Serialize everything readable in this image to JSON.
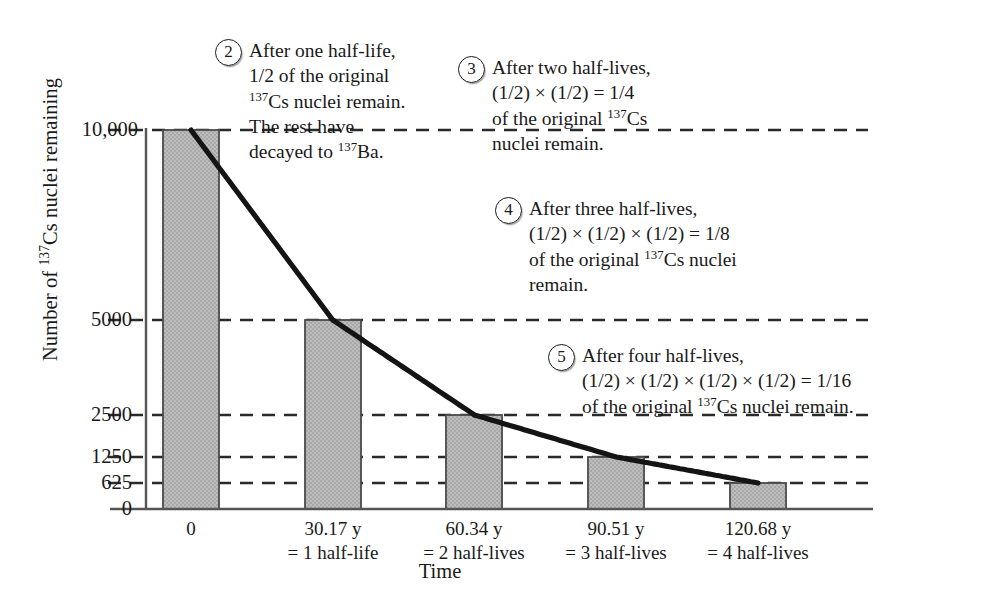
{
  "chart_data": {
    "type": "bar",
    "title": "",
    "xlabel": "Time",
    "ylabel": "Number of 137Cs nuclei remaining",
    "ylabel_parts": {
      "pre": "Number of ",
      "sup": "137",
      "post": "Cs nuclei remaining"
    },
    "categories": [
      "0",
      "30.17 y",
      "60.34 y",
      "90.51 y",
      "120.68 y"
    ],
    "category_sublabels": [
      "",
      "= 1 half-life",
      "= 2 half-lives",
      "= 3 half-lives",
      "= 4 half-lives"
    ],
    "values": [
      10000,
      5000,
      2500,
      1250,
      625
    ],
    "ytick_labels": [
      "10,000",
      "5000",
      "2500",
      "1250",
      "625",
      "0"
    ],
    "ytick_values": [
      10000,
      5000,
      2500,
      1250,
      625,
      0
    ],
    "ylim": [
      0,
      10000
    ],
    "grid": "dashed-horizontal",
    "legend": "none",
    "overlay_curve": {
      "name": "exponential decay",
      "equation": "N = 10000 * (1/2)^(t/30.17)",
      "half_life_years": 30.17
    },
    "colors": {
      "bar_fill": "#b5b5b5",
      "bar_edge": "#4a4a4a",
      "curve": "#141414",
      "axis": "#555555",
      "grid": "#2a2a2a",
      "text": "#1a1a1a"
    }
  },
  "annotations": [
    {
      "number": "2",
      "lines": [
        {
          "pre": "After one half-life,",
          "sup": "",
          "post": ""
        },
        {
          "pre": "1/2 of the original",
          "sup": "",
          "post": ""
        },
        {
          "pre": "",
          "sup": "137",
          "post": "Cs nuclei remain."
        },
        {
          "pre": "The rest have",
          "sup": "",
          "post": ""
        },
        {
          "pre": "decayed to ",
          "sup": "137",
          "post": "Ba."
        }
      ]
    },
    {
      "number": "3",
      "lines": [
        {
          "pre": "After two half-lives,",
          "sup": "",
          "post": ""
        },
        {
          "pre": "(1/2) × (1/2) = 1/4",
          "sup": "",
          "post": ""
        },
        {
          "pre": "of the original ",
          "sup": "137",
          "post": "Cs"
        },
        {
          "pre": "nuclei remain.",
          "sup": "",
          "post": ""
        }
      ]
    },
    {
      "number": "4",
      "lines": [
        {
          "pre": "After three half-lives,",
          "sup": "",
          "post": ""
        },
        {
          "pre": "(1/2) × (1/2) × (1/2) = 1/8",
          "sup": "",
          "post": ""
        },
        {
          "pre": "of the original ",
          "sup": "137",
          "post": "Cs nuclei"
        },
        {
          "pre": "remain.",
          "sup": "",
          "post": ""
        }
      ]
    },
    {
      "number": "5",
      "lines": [
        {
          "pre": "After four half-lives,",
          "sup": "",
          "post": ""
        },
        {
          "pre": "(1/2) × (1/2) × (1/2) × (1/2) = 1/16",
          "sup": "",
          "post": ""
        },
        {
          "pre": "of the original ",
          "sup": "137",
          "post": "Cs nuclei remain."
        }
      ]
    }
  ]
}
